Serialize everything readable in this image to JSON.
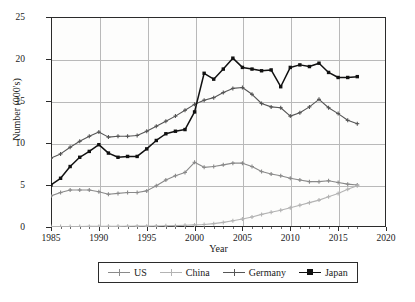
{
  "chart_data": {
    "type": "line",
    "title": "",
    "xlabel": "Year",
    "ylabel": "Number (000's)",
    "xlim": [
      1985,
      2020
    ],
    "ylim": [
      0,
      25
    ],
    "grid": true,
    "legend_position": "bottom",
    "x_ticks": [
      "1985",
      "1990",
      "1995",
      "2000",
      "2005",
      "2010",
      "2015",
      "2020"
    ],
    "y_ticks": [
      "0",
      "5",
      "10",
      "15",
      "20",
      "25"
    ],
    "x": [
      1985,
      1986,
      1987,
      1988,
      1989,
      1990,
      1991,
      1992,
      1993,
      1994,
      1995,
      1996,
      1997,
      1998,
      1999,
      2000,
      2001,
      2002,
      2003,
      2004,
      2005,
      2006,
      2007,
      2008,
      2009,
      2010,
      2011,
      2012,
      2013,
      2014,
      2015,
      2016,
      2017
    ],
    "series": [
      {
        "name": "US",
        "color": "#8a8a8a",
        "marker": "plus",
        "values": [
          3.7,
          4.1,
          4.4,
          4.4,
          4.4,
          4.2,
          3.9,
          4.0,
          4.1,
          4.1,
          4.3,
          4.9,
          5.6,
          6.1,
          6.5,
          7.7,
          7.1,
          7.2,
          7.4,
          7.6,
          7.6,
          7.2,
          6.6,
          6.3,
          6.1,
          5.8,
          5.6,
          5.4,
          5.4,
          5.5,
          5.3,
          5.1,
          5.0
        ]
      },
      {
        "name": "China",
        "color": "#b3b3b3",
        "marker": "plus",
        "values": [
          0.05,
          0.05,
          0.06,
          0.06,
          0.07,
          0.07,
          0.08,
          0.08,
          0.09,
          0.1,
          0.1,
          0.12,
          0.14,
          0.16,
          0.2,
          0.25,
          0.3,
          0.4,
          0.55,
          0.75,
          0.95,
          1.2,
          1.5,
          1.75,
          2.0,
          2.3,
          2.6,
          2.9,
          3.2,
          3.6,
          4.0,
          4.5,
          4.9
        ]
      },
      {
        "name": "Germany",
        "color": "#555555",
        "marker": "plus",
        "values": [
          8.2,
          8.7,
          9.5,
          10.2,
          10.8,
          11.3,
          10.7,
          10.8,
          10.8,
          10.9,
          11.4,
          12.0,
          12.6,
          13.2,
          13.9,
          14.6,
          15.1,
          15.4,
          16.0,
          16.5,
          16.6,
          15.8,
          14.7,
          14.3,
          14.2,
          13.2,
          13.6,
          14.3,
          15.2,
          14.2,
          13.5,
          12.7,
          12.3
        ]
      },
      {
        "name": "Japan",
        "color": "#111111",
        "marker": "square",
        "values": [
          5.0,
          5.8,
          7.2,
          8.3,
          9.0,
          9.8,
          8.8,
          8.3,
          8.4,
          8.4,
          9.3,
          10.3,
          11.1,
          11.4,
          11.6,
          13.7,
          18.3,
          17.6,
          18.8,
          20.1,
          19.0,
          18.8,
          18.6,
          18.7,
          16.7,
          19.0,
          19.3,
          19.1,
          19.5,
          18.4,
          17.8,
          17.8,
          17.9
        ]
      }
    ]
  }
}
